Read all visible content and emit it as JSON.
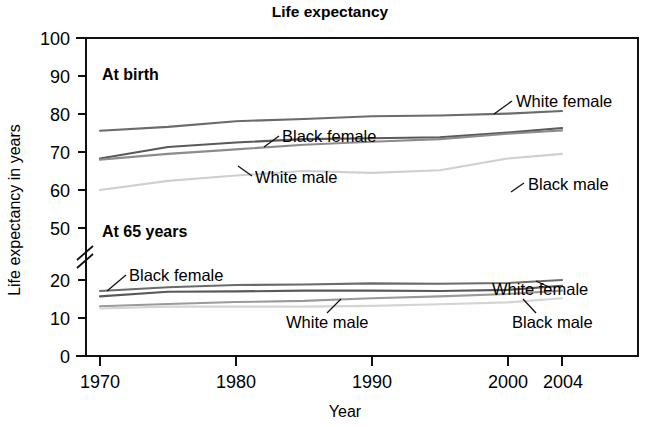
{
  "chart_data": {
    "type": "line",
    "title": "Life expectancy",
    "xlabel": "Year",
    "ylabel": "Life expectancy in years",
    "grid": false,
    "legend_position": "inline-annotations",
    "x": [
      1970,
      1975,
      1980,
      1985,
      1990,
      1995,
      2000,
      2004
    ],
    "xlim": [
      1970,
      2004
    ],
    "xticks": [
      1970,
      1980,
      1990,
      2000,
      2004
    ],
    "xtick_labels": [
      "1970",
      "1980",
      "1990",
      "2000",
      "2004"
    ],
    "yticks": [
      0,
      10,
      20,
      50,
      60,
      70,
      80,
      90,
      100
    ],
    "ytick_labels": [
      "0",
      "10",
      "20",
      "50",
      "60",
      "70",
      "80",
      "90",
      "100"
    ],
    "y_axis_break": {
      "between": [
        20,
        50
      ],
      "label": "axis-break"
    },
    "panels": [
      {
        "name": "At birth",
        "label": "At birth",
        "series": [
          {
            "name": "White female",
            "values": [
              75.6,
              76.6,
              78.1,
              78.7,
              79.4,
              79.6,
              80.1,
              80.8
            ],
            "color": "#6b6b6b"
          },
          {
            "name": "Black female",
            "values": [
              68.3,
              71.3,
              72.5,
              73.4,
              73.6,
              73.9,
              75.1,
              76.3
            ],
            "color": "#595959"
          },
          {
            "name": "White male",
            "values": [
              68.0,
              69.5,
              70.7,
              71.9,
              72.7,
              73.4,
              74.8,
              75.7
            ],
            "color": "#8c8c8c"
          },
          {
            "name": "Black male",
            "values": [
              60.0,
              62.4,
              63.8,
              65.0,
              64.5,
              65.2,
              68.3,
              69.5
            ],
            "color": "#cfcfcf"
          }
        ]
      },
      {
        "name": "At 65 years",
        "label": "At 65 years",
        "series": [
          {
            "name": "White female",
            "values": [
              17.1,
              18.1,
              18.7,
              18.8,
              19.1,
              19.0,
              19.2,
              20.0
            ],
            "color": "#6b6b6b"
          },
          {
            "name": "Black female",
            "values": [
              15.7,
              16.9,
              17.0,
              17.2,
              17.2,
              17.1,
              17.4,
              18.5
            ],
            "color": "#595959"
          },
          {
            "name": "White male",
            "values": [
              13.1,
              13.7,
              14.2,
              14.5,
              15.2,
              15.7,
              16.3,
              17.2
            ],
            "color": "#9a9a9a"
          },
          {
            "name": "Black male",
            "values": [
              12.5,
              13.0,
              13.0,
              13.0,
              13.2,
              13.6,
              14.1,
              15.2
            ],
            "color": "#d4d4d4"
          }
        ]
      }
    ],
    "annotations": [
      {
        "text": "White female",
        "panel": "At birth",
        "x": 1997.0,
        "y": 82.5
      },
      {
        "text": "Black female",
        "panel": "At birth",
        "x": 1983.0,
        "y": 74.5
      },
      {
        "text": "White male",
        "panel": "At birth",
        "x": 1982.0,
        "y": 68.8
      },
      {
        "text": "Black male",
        "panel": "At birth",
        "x": 1998.0,
        "y": 64.5
      },
      {
        "text": "Black female",
        "panel": "At 65 years",
        "x": 1972.5,
        "y": 22.5
      },
      {
        "text": "White female",
        "panel": "At 65 years",
        "x": 1996.5,
        "y": 21.5
      },
      {
        "text": "White male",
        "panel": "At 65 years",
        "x": 1988.0,
        "y": 10.8
      },
      {
        "text": "Black male",
        "panel": "At 65 years",
        "x": 1997.5,
        "y": 10.8
      }
    ]
  },
  "labels": {
    "title": "Life expectancy",
    "ylabel": "Life expectancy in years",
    "xlabel": "Year",
    "group_birth": "At birth",
    "group_65": "At 65 years",
    "tick_y_100": "100",
    "tick_y_90": "90",
    "tick_y_80": "80",
    "tick_y_70": "70",
    "tick_y_60": "60",
    "tick_y_50": "50",
    "tick_y_20": "20",
    "tick_y_10": "10",
    "tick_y_0": "0",
    "tick_x_1970": "1970",
    "tick_x_1980": "1980",
    "tick_x_1990": "1990",
    "tick_x_2000": "2000",
    "tick_x_2004": "2004",
    "ann_wf_birth": "White female",
    "ann_bf_birth": "Black female",
    "ann_wm_birth": "White male",
    "ann_bm_birth": "Black male",
    "ann_bf_65": "Black female",
    "ann_wf_65": "White female",
    "ann_wm_65": "White male",
    "ann_bm_65": "Black male"
  }
}
